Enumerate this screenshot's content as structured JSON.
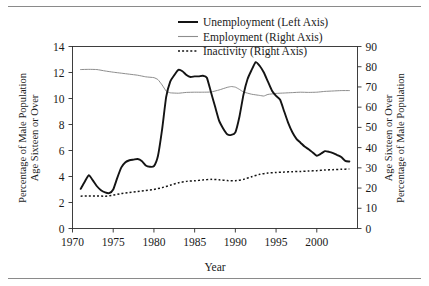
{
  "chart_data": {
    "type": "line",
    "title": "",
    "xlabel": "Year",
    "ylabel_left": "Percentage of Male Population\nAge Sixteen or Over",
    "ylabel_right": "Percentage of Male Population\nAge Sixteen or Over",
    "xlim": [
      1970,
      2005
    ],
    "ylim_left": [
      0,
      14
    ],
    "ylim_right": [
      0,
      90
    ],
    "xticks": [
      1970,
      1975,
      1980,
      1985,
      1990,
      1995,
      2000
    ],
    "xtick_labels": [
      "1970",
      "1975",
      "1980",
      "1985",
      "1990",
      "1995",
      "2000"
    ],
    "yticks_left": [
      0,
      2,
      4,
      6,
      8,
      10,
      12,
      14
    ],
    "ytick_labels_left": [
      "0",
      "2",
      "4",
      "6",
      "8",
      "10",
      "12",
      "14"
    ],
    "yticks_right": [
      0,
      10,
      20,
      30,
      40,
      50,
      60,
      70,
      80,
      90
    ],
    "ytick_labels_right": [
      "0",
      "10",
      "20",
      "30",
      "40",
      "50",
      "60",
      "70",
      "80",
      "90"
    ],
    "grid": false,
    "legend_position": "top-center",
    "series": [
      {
        "name": "Unemployment (Left Axis)",
        "axis": "left",
        "style": "solid-thick",
        "color": "#141414",
        "x": [
          1971.0,
          1971.5,
          1972.0,
          1972.5,
          1973.0,
          1973.5,
          1974.0,
          1974.5,
          1975.0,
          1975.5,
          1976.0,
          1976.5,
          1977.0,
          1977.5,
          1978.0,
          1978.5,
          1979.0,
          1979.5,
          1980.0,
          1980.5,
          1981.0,
          1981.5,
          1982.0,
          1982.5,
          1983.0,
          1983.5,
          1984.0,
          1984.5,
          1985.0,
          1985.5,
          1986.0,
          1986.5,
          1987.0,
          1987.5,
          1988.0,
          1988.5,
          1989.0,
          1989.5,
          1990.0,
          1990.5,
          1991.0,
          1991.5,
          1992.0,
          1992.5,
          1993.0,
          1993.5,
          1994.0,
          1994.5,
          1995.0,
          1995.5,
          1996.0,
          1996.5,
          1997.0,
          1997.5,
          1998.0,
          1998.5,
          1999.0,
          1999.5,
          2000.0,
          2000.5,
          2001.0,
          2001.5,
          2002.0,
          2002.5,
          2003.0,
          2003.5,
          2004.0
        ],
        "y": [
          3.05,
          3.6,
          4.1,
          3.7,
          3.25,
          2.95,
          2.78,
          2.72,
          3.0,
          3.9,
          4.7,
          5.1,
          5.25,
          5.3,
          5.35,
          5.2,
          4.85,
          4.75,
          4.8,
          5.6,
          7.6,
          10.1,
          11.3,
          11.8,
          12.2,
          12.1,
          11.8,
          11.65,
          11.7,
          11.7,
          11.75,
          11.6,
          10.5,
          9.4,
          8.3,
          7.7,
          7.25,
          7.2,
          7.4,
          8.6,
          10.3,
          11.5,
          12.2,
          12.8,
          12.5,
          12.0,
          11.3,
          10.6,
          10.2,
          9.9,
          9.0,
          8.1,
          7.4,
          6.9,
          6.6,
          6.3,
          6.1,
          5.85,
          5.6,
          5.75,
          5.95,
          5.9,
          5.8,
          5.65,
          5.5,
          5.2,
          5.15
        ]
      },
      {
        "name": "Employment (Right Axis)",
        "axis": "right",
        "style": "solid-thin",
        "color": "#8d8d8d",
        "x": [
          1971.0,
          1972.0,
          1973.0,
          1974.0,
          1975.0,
          1976.0,
          1977.0,
          1978.0,
          1979.0,
          1980.0,
          1980.5,
          1981.0,
          1981.5,
          1982.0,
          1983.0,
          1984.0,
          1985.0,
          1986.0,
          1987.0,
          1988.0,
          1989.0,
          1989.5,
          1990.0,
          1990.5,
          1991.0,
          1992.0,
          1993.0,
          1993.5,
          1994.0,
          1995.0,
          1996.0,
          1997.0,
          1998.0,
          1999.0,
          2000.0,
          2001.0,
          2002.0,
          2003.0,
          2004.0
        ],
        "y": [
          78.6,
          78.7,
          78.6,
          77.9,
          77.3,
          76.8,
          76.3,
          75.8,
          75.0,
          74.6,
          73.6,
          71.0,
          68.0,
          67.1,
          66.9,
          67.3,
          67.4,
          67.4,
          67.5,
          68.5,
          69.8,
          70.2,
          69.9,
          68.8,
          67.5,
          66.4,
          65.8,
          65.5,
          66.3,
          66.8,
          67.0,
          67.2,
          67.4,
          67.3,
          67.4,
          67.8,
          68.0,
          68.2,
          68.2
        ]
      },
      {
        "name": "Inactivity (Right Axis)",
        "axis": "right",
        "style": "dotted",
        "color": "#141414",
        "x": [
          1971.0,
          1972.0,
          1973.0,
          1974.0,
          1975.0,
          1976.0,
          1977.0,
          1978.0,
          1979.0,
          1980.0,
          1981.0,
          1982.0,
          1983.0,
          1984.0,
          1985.0,
          1986.0,
          1987.0,
          1988.0,
          1989.0,
          1990.0,
          1991.0,
          1992.0,
          1993.0,
          1994.0,
          1995.0,
          1996.0,
          1997.0,
          1998.0,
          1999.0,
          2000.0,
          2001.0,
          2002.0,
          2003.0,
          2004.0
        ],
        "y": [
          16.0,
          16.1,
          16.1,
          16.0,
          16.5,
          17.3,
          17.8,
          18.3,
          18.8,
          19.3,
          20.2,
          21.4,
          22.6,
          23.3,
          23.6,
          24.0,
          24.3,
          24.1,
          23.7,
          23.6,
          24.3,
          25.6,
          26.8,
          27.4,
          27.7,
          27.9,
          28.1,
          28.2,
          28.4,
          28.6,
          28.9,
          29.1,
          29.3,
          29.4
        ]
      }
    ]
  },
  "legend": {
    "items": [
      {
        "label": "Unemployment (Left Axis)",
        "swatch": "solid-thick-line-icon"
      },
      {
        "label": "Employment (Right Axis)",
        "swatch": "solid-thin-line-icon"
      },
      {
        "label": "Inactivity (Right Axis)",
        "swatch": "dotted-line-icon"
      }
    ]
  },
  "axes": {
    "x_title": "Year",
    "left_title_line1": "Percentage of Male Population",
    "left_title_line2": "Age Sixteen or Over",
    "right_title_line1": "Percentage of Male Population",
    "right_title_line2": "Age Sixteen or Over"
  }
}
